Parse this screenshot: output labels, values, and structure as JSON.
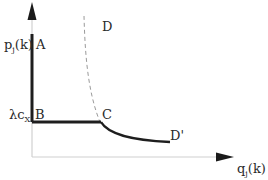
{
  "diagram": {
    "type": "price-quantity curve",
    "y_axis_label": {
      "base": "p",
      "sub": "j",
      "rest": "(k)"
    },
    "x_axis_label": {
      "base": "q",
      "sub": "j",
      "rest": "(k)"
    },
    "y_tick_label": {
      "base": "λc",
      "sub": "X"
    },
    "points": {
      "A": "A",
      "B": "B",
      "C": "C",
      "D": "D",
      "D_prime": "D'"
    },
    "colors": {
      "axis": "#cfcfcf",
      "arrow": "#1a1a1a",
      "curve": "#1e1e1e",
      "dashed": "#9a9a9a",
      "text": "#2a2a2a"
    }
  }
}
